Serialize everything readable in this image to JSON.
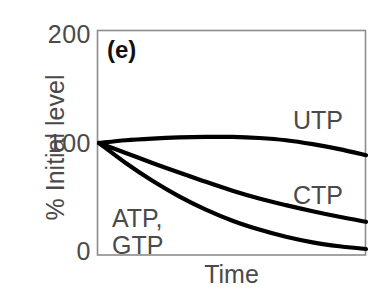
{
  "figure": {
    "panel_label": "(e)",
    "x_axis_title": "Time",
    "y_axis_title": "% Initial level",
    "y_ticks": [
      "200",
      "100",
      "0"
    ],
    "series_labels": {
      "utp": "UTP",
      "ctp": "CTP",
      "atp_gtp_line1": "ATP,",
      "atp_gtp_line2": "GTP"
    },
    "colors": {
      "curve": "#000000",
      "frame": "#808080",
      "text": "#4a4a4a",
      "panel_label": "#101010",
      "background": "#ffffff"
    }
  },
  "chart_data": {
    "type": "line",
    "title": "(e)",
    "xlabel": "Time",
    "ylabel": "% Initial level",
    "xlim": [
      0,
      1
    ],
    "ylim": [
      0,
      200
    ],
    "yticks": [
      0,
      100,
      200
    ],
    "xticks": [],
    "grid": false,
    "legend": "inline-annotations",
    "x_is_qualitative": true,
    "x": [
      0.0,
      0.1,
      0.2,
      0.3,
      0.4,
      0.5,
      0.6,
      0.7,
      0.8,
      0.9,
      1.0
    ],
    "series": [
      {
        "name": "UTP",
        "label_position": "upper-right",
        "values": [
          100,
          102.5,
          104,
          105,
          105.5,
          105.5,
          104.5,
          102.5,
          99,
          94.5,
          89
        ]
      },
      {
        "name": "CTP",
        "label_position": "middle-right",
        "values": [
          100,
          91,
          82,
          73.5,
          65,
          57,
          50,
          44,
          38.5,
          33.5,
          29
        ]
      },
      {
        "name": "ATP, GTP",
        "label_position": "lower-left",
        "values": [
          100,
          82,
          66,
          52,
          40,
          30,
          22,
          15.5,
          10.5,
          7,
          4.5
        ]
      }
    ]
  }
}
